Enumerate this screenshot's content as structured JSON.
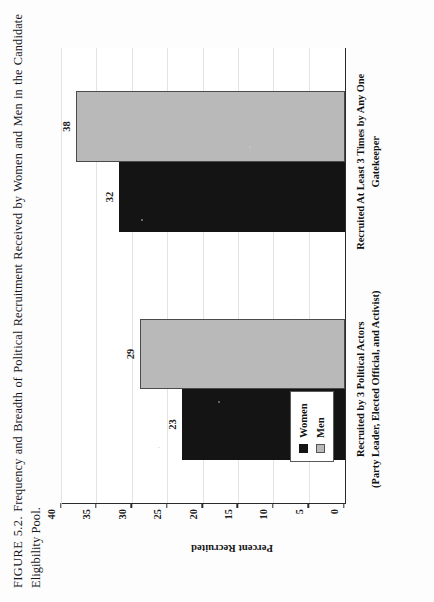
{
  "caption": {
    "figure_label": "FIGURE 5.2.",
    "text": "Frequency and Breadth of Political Recruitment Received by Women and Men in the Candidate Eligibility Pool."
  },
  "chart_data": {
    "type": "bar",
    "title": "",
    "categories": [
      "Recruited by 3 Political Actors",
      "Recruited At Least 3 Times by Any One Gatekeeper"
    ],
    "category_sublabels": [
      "(Party Leader, Elected Official, and Activist)",
      ""
    ],
    "series": [
      {
        "name": "Women",
        "values": [
          23,
          32
        ],
        "color": "#141414"
      },
      {
        "name": "Men",
        "values": [
          29,
          38
        ],
        "color": "#b9b9b9"
      }
    ],
    "xlabel": "",
    "ylabel": "Percent Recruited",
    "ylim": [
      0,
      40
    ],
    "yticks": [
      0,
      5,
      10,
      15,
      20,
      25,
      30,
      35,
      40
    ],
    "ytick_labels": [
      "0",
      "5",
      "10",
      "15",
      "20",
      "25",
      "30",
      "35",
      "40"
    ],
    "data_labels": [
      "23",
      "29",
      "32",
      "38"
    ],
    "grid": true,
    "legend_position": "inside-left",
    "orientation": "vertical"
  },
  "legend": {
    "items": [
      {
        "label": "Women",
        "color": "#141414"
      },
      {
        "label": "Men",
        "color": "#b9b9b9"
      }
    ]
  }
}
